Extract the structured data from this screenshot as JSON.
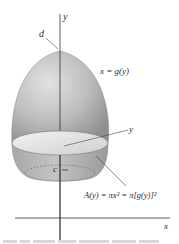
{
  "figure": {
    "labels": {
      "y_axis": "y",
      "x_axis": "x",
      "top": "d",
      "bottom": "c",
      "curve": "x = g(y)",
      "slice": "y",
      "area_formula": "A(y) = πx² = π[g(y)]²"
    },
    "colors": {
      "solid_light": "#d9d9d9",
      "solid_mid": "#b3b3b3",
      "solid_dark": "#8f8f8f",
      "disc_face": "#e6e6e6",
      "axis": "#333333"
    }
  }
}
